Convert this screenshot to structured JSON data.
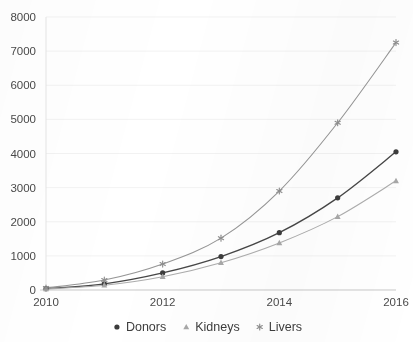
{
  "chart_data": {
    "type": "line",
    "title": "",
    "subtitle": "",
    "xlabel": "",
    "ylabel": "",
    "x": [
      2010,
      2011,
      2012,
      2013,
      2014,
      2015,
      2016
    ],
    "xlim": [
      2010,
      2016
    ],
    "ylim": [
      0,
      8000
    ],
    "x_tick_labels": [
      "2010",
      "2012",
      "2014",
      "2016"
    ],
    "x_tick_values": [
      2010,
      2012,
      2014,
      2016
    ],
    "y_tick_labels": [
      "0",
      "1000",
      "2000",
      "3000",
      "4000",
      "5000",
      "6000",
      "7000",
      "8000"
    ],
    "y_tick_values": [
      0,
      1000,
      2000,
      3000,
      4000,
      5000,
      6000,
      7000,
      8000
    ],
    "grid": true,
    "grid_axis": "y",
    "legend_position": "bottom",
    "series": [
      {
        "name": "Donors",
        "marker": "circle",
        "color": "#3c3c3c",
        "values": [
          40,
          180,
          500,
          980,
          1680,
          2700,
          4050
        ]
      },
      {
        "name": "Kidneys",
        "marker": "triangle",
        "color": "#a8a8a8",
        "values": [
          30,
          140,
          390,
          800,
          1380,
          2150,
          3200
        ]
      },
      {
        "name": "Livers",
        "marker": "asterisk",
        "color": "#8f8f8f",
        "values": [
          60,
          290,
          760,
          1520,
          2900,
          4900,
          7250
        ]
      }
    ]
  },
  "legend": {
    "items": [
      {
        "label": "Donors",
        "marker": "circle",
        "color": "#3c3c3c"
      },
      {
        "label": "Kidneys",
        "marker": "triangle",
        "color": "#a8a8a8"
      },
      {
        "label": "Livers",
        "marker": "asterisk",
        "color": "#8f8f8f"
      }
    ]
  },
  "style": {
    "background": "#ffffff",
    "grid_color": "#ededed",
    "axis_color": "#c9c9c9",
    "tick_text_color": "#4a4a4a",
    "legend_text_color": "#3d3d3d"
  },
  "plot_geometry": {
    "left": 46,
    "right": 396,
    "top": 17,
    "bottom": 290
  }
}
